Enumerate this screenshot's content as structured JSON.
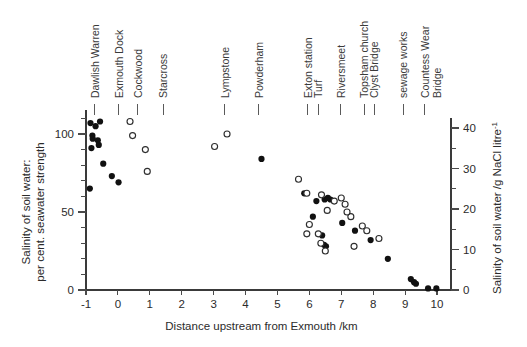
{
  "chart_data": {
    "type": "scatter",
    "title": "",
    "xlabel": "Distance upstream from Exmouth  /km",
    "ylabel_left": "Salinity of soil water:\nper cent. seawater strength",
    "ylabel_right": "Salinity of soil water  /g NaCl litre",
    "ylabel_right_sup": "-1",
    "ylabel_left_line1": "Salinity of soil water:",
    "ylabel_left_line2": "per cent. seawater strength",
    "xlim": [
      -1.45,
      10.6
    ],
    "ylim": [
      -3,
      122
    ],
    "ylim_right": [
      -1.05,
      42.7
    ],
    "grid": false,
    "legend": "none",
    "xticks": [
      -1,
      0,
      1,
      2,
      3,
      4,
      5,
      6,
      7,
      8,
      9,
      10
    ],
    "xticklabels": [
      "-1",
      "0",
      "1",
      "2",
      "3",
      "4",
      "5",
      "6",
      "7",
      "8",
      "9",
      "10"
    ],
    "yticks_left_major": [
      0,
      50,
      100
    ],
    "yticklabels_left": [
      "0",
      "50",
      "100"
    ],
    "yticks_left_minor": [
      10,
      20,
      30,
      40,
      60,
      70,
      80,
      90,
      110
    ],
    "yticks_right_major": [
      0,
      10,
      20,
      30,
      40
    ],
    "yticklabels_right": [
      "0",
      "10",
      "20",
      "30",
      "40"
    ],
    "yticks_right_minor": [
      5,
      15,
      25,
      35
    ],
    "location_markers": [
      {
        "label": "Dawlish Warren",
        "x": -0.72,
        "lines": [
          "Dawlish Warren"
        ]
      },
      {
        "label": "Exmouth Dock",
        "x": 0.03,
        "lines": [
          "Exmouth Dock"
        ]
      },
      {
        "label": "Cockwood",
        "x": 0.62,
        "lines": [
          "Cockwood"
        ]
      },
      {
        "label": "Starcross",
        "x": 1.42,
        "lines": [
          "Starcross"
        ]
      },
      {
        "label": "Lympstone",
        "x": 3.35,
        "lines": [
          "Lympstone"
        ]
      },
      {
        "label": "Powderham",
        "x": 4.42,
        "lines": [
          "Powderham"
        ]
      },
      {
        "label": "Exton station",
        "x": 5.95,
        "lines": [
          "Exton station"
        ]
      },
      {
        "label": "Turf",
        "x": 6.28,
        "lines": [
          "Turf"
        ]
      },
      {
        "label": "Riversmeet",
        "x": 6.98,
        "lines": [
          "Riversmeet"
        ]
      },
      {
        "label": "Topsham church",
        "x": 7.72,
        "lines": [
          "Topsham church"
        ]
      },
      {
        "label": "Clyst Bridge",
        "x": 7.72,
        "lines": [
          "Clyst Bridge"
        ],
        "stacked": true
      },
      {
        "label": "sewage works",
        "x": 8.95,
        "lines": [
          "sewage works"
        ]
      },
      {
        "label": "Countess Wear Bridge",
        "x": 9.62,
        "lines": [
          "Countess Wear",
          "Bridge"
        ]
      }
    ],
    "series": [
      {
        "name": "filled",
        "marker": "filled-circle",
        "color": "#111111",
        "points": [
          [
            -0.86,
            107
          ],
          [
            -0.7,
            105
          ],
          [
            -0.8,
            99
          ],
          [
            -0.79,
            97
          ],
          [
            -0.83,
            91
          ],
          [
            -0.63,
            96
          ],
          [
            -0.56,
            108
          ],
          [
            -0.6,
            93
          ],
          [
            -0.88,
            65
          ],
          [
            -0.46,
            81
          ],
          [
            -0.19,
            73
          ],
          [
            0.02,
            69
          ],
          [
            4.5,
            84
          ],
          [
            5.84,
            62
          ],
          [
            6.22,
            57
          ],
          [
            6.48,
            58
          ],
          [
            6.58,
            59
          ],
          [
            6.66,
            58
          ],
          [
            6.11,
            47
          ],
          [
            6.4,
            35
          ],
          [
            6.46,
            29
          ],
          [
            6.52,
            28
          ],
          [
            7.03,
            43
          ],
          [
            7.43,
            38
          ],
          [
            7.92,
            32
          ],
          [
            8.46,
            20
          ],
          [
            9.18,
            7
          ],
          [
            9.28,
            5
          ],
          [
            9.34,
            4
          ],
          [
            9.72,
            1
          ],
          [
            9.98,
            1
          ]
        ]
      },
      {
        "name": "open",
        "marker": "open-circle",
        "color": "#2e2e2e",
        "points": [
          [
            0.38,
            108
          ],
          [
            0.46,
            99
          ],
          [
            0.86,
            90
          ],
          [
            0.92,
            76
          ],
          [
            3.03,
            92
          ],
          [
            3.42,
            100
          ],
          [
            5.66,
            71
          ],
          [
            5.92,
            62
          ],
          [
            6.38,
            61
          ],
          [
            6.78,
            57
          ],
          [
            7.0,
            59
          ],
          [
            7.12,
            55
          ],
          [
            6.56,
            51
          ],
          [
            6.0,
            42
          ],
          [
            5.92,
            36
          ],
          [
            6.28,
            36
          ],
          [
            6.36,
            30
          ],
          [
            6.5,
            25
          ],
          [
            7.3,
            47
          ],
          [
            7.4,
            28
          ],
          [
            7.18,
            50
          ],
          [
            7.66,
            41
          ],
          [
            7.8,
            38
          ],
          [
            8.18,
            33
          ]
        ]
      }
    ]
  }
}
